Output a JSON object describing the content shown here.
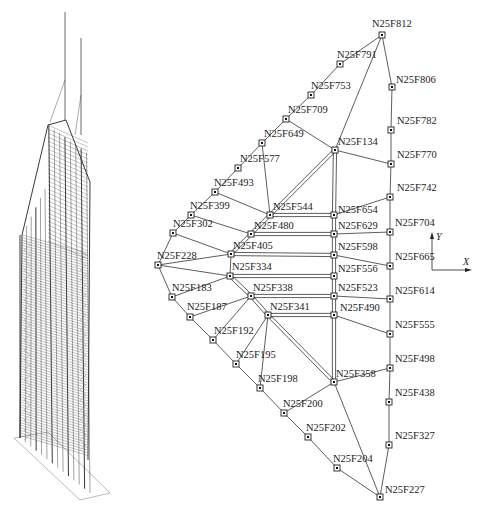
{
  "figure": {
    "left_panel": {
      "description": "3D wireframe structural model of skyscraper"
    },
    "axes": {
      "y_label": "Y",
      "x_label": "X"
    },
    "nodes": [
      {
        "id": "N25F812",
        "x": 382,
        "y": 35,
        "lx": 372,
        "ly": 27
      },
      {
        "id": "N25F791",
        "x": 340,
        "y": 64,
        "lx": 337,
        "ly": 58
      },
      {
        "id": "N25F753",
        "x": 311,
        "y": 95,
        "lx": 311,
        "ly": 89
      },
      {
        "id": "N25F709",
        "x": 286,
        "y": 119,
        "lx": 288,
        "ly": 113
      },
      {
        "id": "N25F649",
        "x": 262,
        "y": 143,
        "lx": 264,
        "ly": 137
      },
      {
        "id": "N25F577",
        "x": 238,
        "y": 168,
        "lx": 240,
        "ly": 162
      },
      {
        "id": "N25F493",
        "x": 215,
        "y": 192,
        "lx": 214,
        "ly": 186
      },
      {
        "id": "N25F399",
        "x": 191,
        "y": 215,
        "lx": 190,
        "ly": 209
      },
      {
        "id": "N25F302",
        "x": 173,
        "y": 233,
        "lx": 173,
        "ly": 227
      },
      {
        "id": "N25F228",
        "x": 158,
        "y": 265,
        "lx": 157,
        "ly": 259
      },
      {
        "id": "N25F183",
        "x": 172,
        "y": 297,
        "lx": 172,
        "ly": 291
      },
      {
        "id": "N25F187",
        "x": 190,
        "y": 317,
        "lx": 187,
        "ly": 310
      },
      {
        "id": "N25F192",
        "x": 213,
        "y": 340,
        "lx": 214,
        "ly": 334
      },
      {
        "id": "N25F195",
        "x": 236,
        "y": 364,
        "lx": 236,
        "ly": 358
      },
      {
        "id": "N25F198",
        "x": 260,
        "y": 388,
        "lx": 258,
        "ly": 382
      },
      {
        "id": "N25F200",
        "x": 284,
        "y": 413,
        "lx": 283,
        "ly": 407
      },
      {
        "id": "N25F202",
        "x": 308,
        "y": 437,
        "lx": 306,
        "ly": 431
      },
      {
        "id": "N25F204",
        "x": 337,
        "y": 468,
        "lx": 333,
        "ly": 462
      },
      {
        "id": "N25F227",
        "x": 380,
        "y": 497,
        "lx": 385,
        "ly": 493
      },
      {
        "id": "N25F806",
        "x": 392,
        "y": 87,
        "lx": 396,
        "ly": 83
      },
      {
        "id": "N25F782",
        "x": 391,
        "y": 130,
        "lx": 397,
        "ly": 124
      },
      {
        "id": "N25F770",
        "x": 391,
        "y": 164,
        "lx": 397,
        "ly": 158
      },
      {
        "id": "N25F742",
        "x": 390,
        "y": 197,
        "lx": 397,
        "ly": 191
      },
      {
        "id": "N25F704",
        "x": 390,
        "y": 232,
        "lx": 395,
        "ly": 226
      },
      {
        "id": "N25F665",
        "x": 390,
        "y": 266,
        "lx": 395,
        "ly": 260
      },
      {
        "id": "N25F614",
        "x": 390,
        "y": 299,
        "lx": 395,
        "ly": 294
      },
      {
        "id": "N25F555",
        "x": 390,
        "y": 334,
        "lx": 395,
        "ly": 328
      },
      {
        "id": "N25F498",
        "x": 390,
        "y": 368,
        "lx": 395,
        "ly": 362
      },
      {
        "id": "N25F438",
        "x": 389,
        "y": 402,
        "lx": 395,
        "ly": 396
      },
      {
        "id": "N25F327",
        "x": 389,
        "y": 445,
        "lx": 395,
        "ly": 439
      },
      {
        "id": "N25F134",
        "x": 335,
        "y": 150,
        "lx": 338,
        "ly": 145
      },
      {
        "id": "N25F544",
        "x": 270,
        "y": 215,
        "lx": 273,
        "ly": 210
      },
      {
        "id": "N25F480",
        "x": 251,
        "y": 234,
        "lx": 254,
        "ly": 229
      },
      {
        "id": "N25F405",
        "x": 231,
        "y": 254,
        "lx": 233,
        "ly": 249
      },
      {
        "id": "N25F334",
        "x": 230,
        "y": 276,
        "lx": 232,
        "ly": 270
      },
      {
        "id": "N25F338",
        "x": 251,
        "y": 296,
        "lx": 253,
        "ly": 291
      },
      {
        "id": "N25F341",
        "x": 268,
        "y": 315,
        "lx": 270,
        "ly": 310
      },
      {
        "id": "N25F358",
        "x": 334,
        "y": 382,
        "lx": 336,
        "ly": 377
      },
      {
        "id": "N25F654",
        "x": 334,
        "y": 215,
        "lx": 338,
        "ly": 213
      },
      {
        "id": "N25F629",
        "x": 334,
        "y": 234,
        "lx": 338,
        "ly": 229
      },
      {
        "id": "N25F598",
        "x": 334,
        "y": 255,
        "lx": 338,
        "ly": 250
      },
      {
        "id": "N25F556",
        "x": 334,
        "y": 276,
        "lx": 338,
        "ly": 272
      },
      {
        "id": "N25F523",
        "x": 334,
        "y": 296,
        "lx": 338,
        "ly": 291
      },
      {
        "id": "N25F490",
        "x": 334,
        "y": 315,
        "lx": 340,
        "ly": 311
      }
    ],
    "edges": [
      [
        "N25F812",
        "N25F791"
      ],
      [
        "N25F791",
        "N25F753"
      ],
      [
        "N25F753",
        "N25F709"
      ],
      [
        "N25F709",
        "N25F649"
      ],
      [
        "N25F649",
        "N25F577"
      ],
      [
        "N25F577",
        "N25F493"
      ],
      [
        "N25F493",
        "N25F399"
      ],
      [
        "N25F399",
        "N25F302"
      ],
      [
        "N25F302",
        "N25F228"
      ],
      [
        "N25F228",
        "N25F183"
      ],
      [
        "N25F183",
        "N25F187"
      ],
      [
        "N25F187",
        "N25F192"
      ],
      [
        "N25F192",
        "N25F195"
      ],
      [
        "N25F195",
        "N25F198"
      ],
      [
        "N25F198",
        "N25F200"
      ],
      [
        "N25F200",
        "N25F202"
      ],
      [
        "N25F202",
        "N25F204"
      ],
      [
        "N25F204",
        "N25F227"
      ],
      [
        "N25F812",
        "N25F806"
      ],
      [
        "N25F806",
        "N25F782"
      ],
      [
        "N25F782",
        "N25F770"
      ],
      [
        "N25F770",
        "N25F742"
      ],
      [
        "N25F742",
        "N25F704"
      ],
      [
        "N25F704",
        "N25F665"
      ],
      [
        "N25F665",
        "N25F614"
      ],
      [
        "N25F614",
        "N25F555"
      ],
      [
        "N25F555",
        "N25F498"
      ],
      [
        "N25F498",
        "N25F438"
      ],
      [
        "N25F438",
        "N25F327"
      ],
      [
        "N25F327",
        "N25F227"
      ],
      [
        "N25F812",
        "N25F134"
      ],
      [
        "N25F709",
        "N25F134"
      ],
      [
        "N25F134",
        "N25F770"
      ],
      [
        "N25F649",
        "N25F544"
      ],
      [
        "N25F493",
        "N25F544"
      ],
      [
        "N25F399",
        "N25F480"
      ],
      [
        "N25F302",
        "N25F405"
      ],
      [
        "N25F228",
        "N25F405"
      ],
      [
        "N25F228",
        "N25F334"
      ],
      [
        "N25F183",
        "N25F334"
      ],
      [
        "N25F187",
        "N25F338"
      ],
      [
        "N25F192",
        "N25F338"
      ],
      [
        "N25F195",
        "N25F341"
      ],
      [
        "N25F198",
        "N25F341"
      ],
      [
        "N25F405",
        "N25F334"
      ],
      [
        "N25F654",
        "N25F742"
      ],
      [
        "N25F629",
        "N25F704"
      ],
      [
        "N25F598",
        "N25F665"
      ],
      [
        "N25F523",
        "N25F614"
      ],
      [
        "N25F490",
        "N25F555"
      ],
      [
        "N25F358",
        "N25F498"
      ],
      [
        "N25F358",
        "N25F200"
      ],
      [
        "N25F358",
        "N25F227"
      ]
    ],
    "double_edges": [
      [
        "N25F544",
        "N25F134"
      ],
      [
        "N25F134",
        "N25F654"
      ],
      [
        "N25F654",
        "N25F629"
      ],
      [
        "N25F629",
        "N25F598"
      ],
      [
        "N25F598",
        "N25F556"
      ],
      [
        "N25F556",
        "N25F523"
      ],
      [
        "N25F523",
        "N25F490"
      ],
      [
        "N25F490",
        "N25F358"
      ],
      [
        "N25F544",
        "N25F654"
      ],
      [
        "N25F480",
        "N25F629"
      ],
      [
        "N25F405",
        "N25F598"
      ],
      [
        "N25F334",
        "N25F556"
      ],
      [
        "N25F338",
        "N25F523"
      ],
      [
        "N25F341",
        "N25F490"
      ],
      [
        "N25F334",
        "N25F338"
      ],
      [
        "N25F338",
        "N25F341"
      ],
      [
        "N25F341",
        "N25F358"
      ],
      [
        "N25F544",
        "N25F480"
      ],
      [
        "N25F480",
        "N25F405"
      ]
    ]
  }
}
